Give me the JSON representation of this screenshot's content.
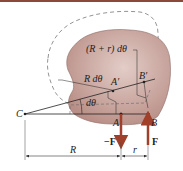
{
  "diagram": {
    "colors": {
      "body_fill": "#c9a8a0",
      "body_stroke": "#7a5a55",
      "force_arrow": "#a0402a",
      "line": "#222222",
      "dashed": "#666666",
      "top_bar": "#8a4a3a"
    },
    "labels": {
      "point_c": "C",
      "point_a": "A",
      "point_b": "B",
      "point_a_prime": "A′",
      "point_b_prime": "B′",
      "arc_outer": "(R + r) dθ",
      "arc_inner": "R dθ",
      "angle": "dθ",
      "force_neg": "−F",
      "force_pos": "F",
      "dim_R": "R",
      "dim_r": "r"
    }
  }
}
